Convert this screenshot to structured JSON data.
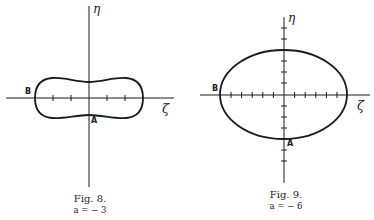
{
  "figures": [
    {
      "id": "fig8",
      "caption": "Fig. 8.",
      "parameter": "a = − 3",
      "axis_labels": {
        "horizontal": "ζ",
        "vertical": "η"
      },
      "point_labels": {
        "A": "A",
        "B": "B"
      },
      "curve_shape": "peanut / dumbbell-shaped closed curve"
    },
    {
      "id": "fig9",
      "caption": "Fig. 9.",
      "parameter": "a = − 6",
      "axis_labels": {
        "horizontal": "ζ",
        "vertical": "η"
      },
      "point_labels": {
        "A": "A",
        "B": "B"
      },
      "curve_shape": "ellipse-like closed curve"
    }
  ],
  "colors": {
    "ink": "#1a1a1a",
    "background": "#ffffff"
  }
}
